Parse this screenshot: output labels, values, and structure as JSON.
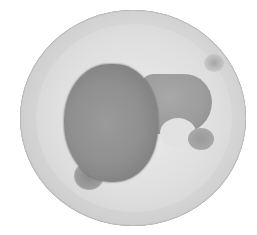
{
  "image": {
    "subject": "embryo-in-chorion-micrograph",
    "colors": {
      "background": "#ffffff",
      "chorion": "#dcdcdc",
      "chorion_edge": "#555555",
      "yolk": "#8f8f8f",
      "embryo_body": "#9c9c9c"
    }
  }
}
